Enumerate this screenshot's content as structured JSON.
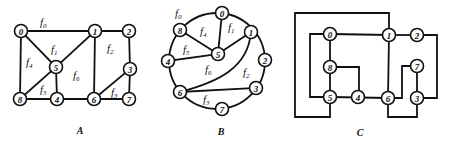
{
  "figure": {
    "panels": [
      {
        "id": "A",
        "caption": "A",
        "caption_pos": [
          80,
          134
        ],
        "nodes": [
          {
            "label": "0",
            "x": 21,
            "y": 31
          },
          {
            "label": "1",
            "x": 95,
            "y": 31
          },
          {
            "label": "2",
            "x": 129,
            "y": 31
          },
          {
            "label": "3",
            "x": 130,
            "y": 69
          },
          {
            "label": "4",
            "x": 57,
            "y": 99
          },
          {
            "label": "5",
            "x": 56,
            "y": 67
          },
          {
            "label": "6",
            "x": 94,
            "y": 99
          },
          {
            "label": "7",
            "x": 129,
            "y": 99
          },
          {
            "label": "8",
            "x": 20,
            "y": 99
          }
        ],
        "edges": [
          [
            "0",
            "1"
          ],
          [
            "1",
            "2"
          ],
          [
            "2",
            "3"
          ],
          [
            "3",
            "7"
          ],
          [
            "7",
            "6"
          ],
          [
            "6",
            "3"
          ],
          [
            "6",
            "1"
          ],
          [
            "1",
            "5"
          ],
          [
            "5",
            "0"
          ],
          [
            "0",
            "8"
          ],
          [
            "8",
            "5"
          ],
          [
            "5",
            "4"
          ],
          [
            "8",
            "4"
          ],
          [
            "4",
            "6"
          ]
        ],
        "faces": [
          {
            "name": "f",
            "sub": "0",
            "x": 40,
            "y": 26
          },
          {
            "name": "f",
            "sub": "1",
            "x": 51,
            "y": 53
          },
          {
            "name": "f",
            "sub": "2",
            "x": 107,
            "y": 52
          },
          {
            "name": "f",
            "sub": "3",
            "x": 111,
            "y": 96
          },
          {
            "name": "f",
            "sub": "4",
            "x": 26,
            "y": 66
          },
          {
            "name": "f",
            "sub": "5",
            "x": 40,
            "y": 93
          },
          {
            "name": "f",
            "sub": "6",
            "x": 73,
            "y": 79
          }
        ]
      },
      {
        "id": "B",
        "caption": "B",
        "caption_pos": [
          221,
          135
        ],
        "nodes": [
          {
            "label": "0",
            "x": 222,
            "y": 13
          },
          {
            "label": "1",
            "x": 251,
            "y": 32
          },
          {
            "label": "2",
            "x": 265,
            "y": 60
          },
          {
            "label": "3",
            "x": 256,
            "y": 88
          },
          {
            "label": "4",
            "x": 168,
            "y": 61
          },
          {
            "label": "5",
            "x": 218,
            "y": 54
          },
          {
            "label": "6",
            "x": 180,
            "y": 92
          },
          {
            "label": "7",
            "x": 222,
            "y": 109
          },
          {
            "label": "8",
            "x": 180,
            "y": 30
          }
        ],
        "straight_edges": [
          [
            "0",
            "5"
          ],
          [
            "8",
            "5"
          ],
          [
            "1",
            "5"
          ],
          [
            "4",
            "5"
          ],
          [
            "6",
            "3"
          ]
        ],
        "curved_edge_1_6": "M251,32 C248,68 218,82 180,92",
        "circle": {
          "cx": 217,
          "cy": 61,
          "r": 48
        },
        "faces": [
          {
            "name": "f",
            "sub": "0",
            "x": 175,
            "y": 17
          },
          {
            "name": "f",
            "sub": "1",
            "x": 228,
            "y": 31
          },
          {
            "name": "f",
            "sub": "2",
            "x": 243,
            "y": 76
          },
          {
            "name": "f",
            "sub": "3",
            "x": 203,
            "y": 103
          },
          {
            "name": "f",
            "sub": "4",
            "x": 200,
            "y": 35
          },
          {
            "name": "f",
            "sub": "5",
            "x": 183,
            "y": 53
          },
          {
            "name": "f",
            "sub": "6",
            "x": 205,
            "y": 73
          }
        ]
      },
      {
        "id": "C",
        "caption": "C",
        "caption_pos": [
          360,
          136
        ],
        "nodes": [
          {
            "label": "0",
            "x": 330,
            "y": 34
          },
          {
            "label": "1",
            "x": 389,
            "y": 35
          },
          {
            "label": "2",
            "x": 417,
            "y": 35
          },
          {
            "label": "3",
            "x": 417,
            "y": 98
          },
          {
            "label": "4",
            "x": 358,
            "y": 97
          },
          {
            "label": "5",
            "x": 330,
            "y": 97
          },
          {
            "label": "6",
            "x": 388,
            "y": 98
          },
          {
            "label": "7",
            "x": 417,
            "y": 66
          },
          {
            "label": "8",
            "x": 330,
            "y": 67
          }
        ],
        "polylines": [
          "389,35 389,13 295,13 295,117 330,117 330,97",
          "330,34 310,34 310,97 330,97",
          "330,34 389,35",
          "389,35 417,35",
          "330,34 330,97",
          "330,97 388,98",
          "330,67 359,67 359,97",
          "389,35 388,98",
          "388,98 388,117 417,117 417,98",
          "388,98 402,98 402,66 417,66",
          "417,66 417,98",
          "417,35 437,35 437,98 417,98"
        ]
      }
    ]
  }
}
